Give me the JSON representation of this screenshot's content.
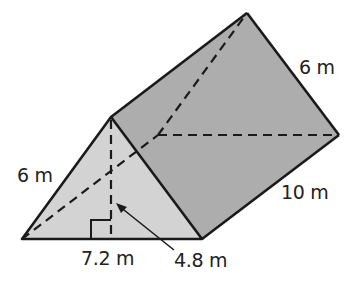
{
  "figure": {
    "type": "triangular-prism",
    "colors": {
      "front_face": "#d4d4d4",
      "side_face": "#ababab",
      "top_face": "#b5b5b5",
      "edge": "#1a1a1a"
    },
    "labels": {
      "slant_left": "6 m",
      "back_edge": "6 m",
      "length": "10 m",
      "base": "7.2 m",
      "height": "4.8 m"
    }
  }
}
